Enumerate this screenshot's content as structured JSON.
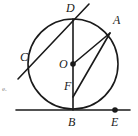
{
  "figure": {
    "kind": "circle-geometry-diagram",
    "width": 138,
    "height": 136,
    "background_color": "#ffffff",
    "stroke_color": "#1a1a1a",
    "label_color": "#1a1a1a",
    "margin_mark_color": "#8a8a8a"
  },
  "circle": {
    "center_x": 73,
    "center_y": 64,
    "radius": 45,
    "stroke_width": 1.6
  },
  "points": {
    "A": {
      "label": "A",
      "x": 110,
      "y": 33,
      "dot": false,
      "label_x": 113,
      "label_y": 14
    },
    "B": {
      "label": "B",
      "x": 73,
      "y": 110,
      "dot": false,
      "label_x": 68,
      "label_y": 116
    },
    "C": {
      "label": "C",
      "x": 38,
      "y": 57,
      "dot": false,
      "label_x": 20,
      "label_y": 51
    },
    "D": {
      "label": "D",
      "x": 73,
      "y": 19,
      "dot": false,
      "label_x": 66,
      "label_y": 2
    },
    "E": {
      "label": "E",
      "x": 115,
      "y": 110,
      "dot": true,
      "label_x": 111,
      "label_y": 116
    },
    "F": {
      "label": "F",
      "x": 73,
      "y": 86,
      "dot": false,
      "label_x": 64,
      "label_y": 80
    },
    "O": {
      "label": "O",
      "x": 73,
      "y": 64,
      "dot": true,
      "label_x": 59,
      "label_y": 58
    }
  },
  "segments": [
    {
      "name": "diameter-DB",
      "x1": 73,
      "y1": 19,
      "x2": 73,
      "y2": 110,
      "stroke_width": 1.6
    },
    {
      "name": "secant-through-D-and-C",
      "x1": 89,
      "y1": 4,
      "x2": 18,
      "y2": 79,
      "stroke_width": 1.6
    },
    {
      "name": "radius-OA",
      "x1": 73,
      "y1": 64,
      "x2": 110,
      "y2": 33,
      "stroke_width": 1.6
    },
    {
      "name": "chord-FA",
      "x1": 73,
      "y1": 97,
      "x2": 110,
      "y2": 33,
      "stroke_width": 1.6
    },
    {
      "name": "tangent-line-at-B",
      "x1": 16,
      "y1": 110,
      "x2": 130,
      "y2": 110,
      "stroke_width": 1.6
    }
  ],
  "dots": [
    {
      "name": "center-dot-O",
      "x": 73,
      "y": 64,
      "r": 2.8
    },
    {
      "name": "point-dot-E",
      "x": 115,
      "y": 110,
      "r": 2.8
    }
  ],
  "margin_mark": {
    "text": "e.",
    "x": 2,
    "y": 86
  }
}
